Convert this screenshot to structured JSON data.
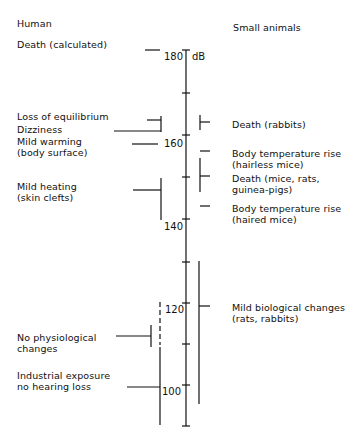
{
  "headers": {
    "left": "Human",
    "right": "Small animals"
  },
  "axis": {
    "unit": "dB",
    "ticks": [
      "180",
      "160",
      "140",
      "120",
      "100"
    ],
    "minor_ticks": [
      170,
      150,
      130,
      110
    ]
  },
  "human": [
    {
      "label": "Death (calculated)",
      "level": "180"
    },
    {
      "label": "Loss of equilibrium",
      "level": "164-168"
    },
    {
      "label": "Dizziness",
      "level": "164-168"
    },
    {
      "label": "Mild warming\n(body surface)",
      "level": "160"
    },
    {
      "label": "Mild heating\n(skin clefts)",
      "level": "140-150"
    },
    {
      "label": "No physiological\nchanges",
      "level": "110-115"
    },
    {
      "label": "Industrial exposure\nno hearing loss",
      "level": "90-110"
    }
  ],
  "animals": [
    {
      "label": "Death (rabbits)",
      "level": "164-168"
    },
    {
      "label": "Body temperature rise\n(hairless mice)",
      "level": "158"
    },
    {
      "label": "Death (mice, rats,\nguinea-pigs)",
      "level": "145-155"
    },
    {
      "label": "Body temperature rise\n(haired mice)",
      "level": "142"
    },
    {
      "label": "Mild biological changes\n(rats, rabbits)",
      "level": "95-130"
    }
  ]
}
